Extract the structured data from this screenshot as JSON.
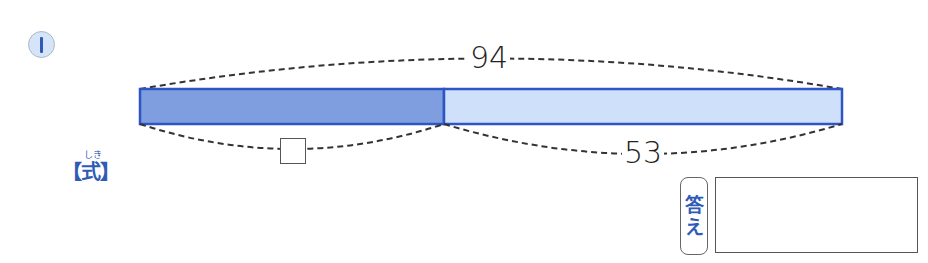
{
  "problem": {
    "number": "1"
  },
  "diagram": {
    "total": "94",
    "known_part": "53",
    "unknown_part": "□",
    "colors": {
      "unknown_segment_fill": "#7f9ee0",
      "known_segment_fill": "#cfe0fa",
      "bar_border": "#2f55c4",
      "brace_dash": "#333333"
    }
  },
  "formula": {
    "ruby": "しき",
    "label": "【式】"
  },
  "answer": {
    "label_line1": "答",
    "label_line2": "え",
    "value": ""
  }
}
